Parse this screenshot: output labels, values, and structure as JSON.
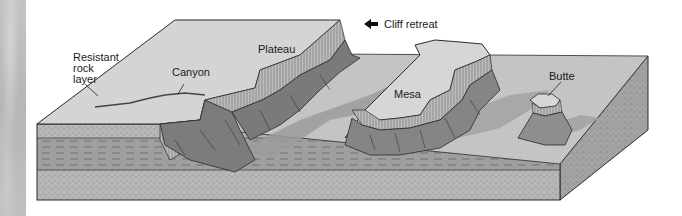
{
  "diagram": {
    "type": "block-diagram",
    "labels": {
      "cliff_retreat": "Cliff retreat",
      "plateau": "Plateau",
      "canyon": "Canyon",
      "mesa": "Mesa",
      "butte": "Butte",
      "resistant_rock_line1": "Resistant",
      "resistant_rock_line2": "rock",
      "resistant_rock_line3": "layer"
    },
    "icons": {
      "cliff_retreat_arrow": "arrow-left"
    },
    "colors": {
      "surface_light": "#d3d3d3",
      "surface_valley": "#c2c2c2",
      "shadow_valley": "#9a9a9a",
      "cliff_dark": "#7a7a7a",
      "cliff_band": "#b4b4b4",
      "layer_sand": "#b9b9b9",
      "layer_shale": "#9e9e9e",
      "side_face": "#a8a8a8",
      "outline": "#2a2a2a",
      "photo_strip": "#c0c0c0"
    }
  }
}
